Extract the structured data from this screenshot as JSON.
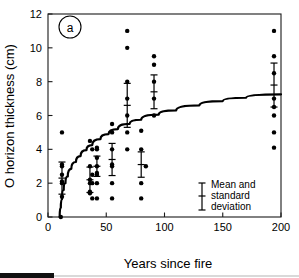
{
  "figure": {
    "panel_label": "a",
    "background_color": "#ffffff",
    "ink_color": "#000000"
  },
  "legend": {
    "name": "mean-and-standard-deviation",
    "lines": [
      "Mean and",
      "standard",
      "deviation"
    ],
    "glyph": "error-bar-icon"
  },
  "chart_data": {
    "type": "scatter",
    "title": "",
    "subtitle": "",
    "xlabel": "Years since fire",
    "ylabel": "O horizon thickness (cm)",
    "xlim": [
      0,
      200
    ],
    "ylim": [
      0,
      12
    ],
    "xticks": [
      0,
      50,
      100,
      150,
      200
    ],
    "xtick_labels": [
      "0",
      "50",
      "100",
      "150",
      "200"
    ],
    "yticks": [
      0,
      2,
      4,
      6,
      8,
      10,
      12
    ],
    "ytick_labels": [
      "0",
      "2",
      "4",
      "6",
      "8",
      "10",
      "12"
    ],
    "grid": false,
    "legend_position": "bottom-right",
    "annotations": [
      {
        "name": "panel-label",
        "text": "a",
        "x": 12,
        "y": 11.2
      }
    ],
    "series": [
      {
        "name": "individual-observations",
        "type": "scatter",
        "marker": "filled-circle",
        "color": "#000000",
        "points": [
          {
            "x": 11,
            "y": 0.0
          },
          {
            "x": 12,
            "y": 1.2
          },
          {
            "x": 12,
            "y": 2.0
          },
          {
            "x": 12,
            "y": 2.1
          },
          {
            "x": 12,
            "y": 2.5
          },
          {
            "x": 12,
            "y": 3.0
          },
          {
            "x": 12,
            "y": 3.1
          },
          {
            "x": 12,
            "y": 5.0
          },
          {
            "x": 36,
            "y": 1.4
          },
          {
            "x": 36,
            "y": 1.5
          },
          {
            "x": 36,
            "y": 2.0
          },
          {
            "x": 36,
            "y": 2.2
          },
          {
            "x": 36,
            "y": 3.0
          },
          {
            "x": 36,
            "y": 4.5
          },
          {
            "x": 38,
            "y": 1.1
          },
          {
            "x": 38,
            "y": 2.0
          },
          {
            "x": 38,
            "y": 2.5
          },
          {
            "x": 38,
            "y": 4.0
          },
          {
            "x": 42,
            "y": 1.1
          },
          {
            "x": 42,
            "y": 2.0
          },
          {
            "x": 42,
            "y": 2.5
          },
          {
            "x": 42,
            "y": 2.6
          },
          {
            "x": 42,
            "y": 3.0
          },
          {
            "x": 42,
            "y": 3.5
          },
          {
            "x": 42,
            "y": 4.0
          },
          {
            "x": 42,
            "y": 4.1
          },
          {
            "x": 55,
            "y": 1.1
          },
          {
            "x": 55,
            "y": 2.0
          },
          {
            "x": 55,
            "y": 3.0
          },
          {
            "x": 55,
            "y": 3.1
          },
          {
            "x": 55,
            "y": 4.0
          },
          {
            "x": 55,
            "y": 5.0
          },
          {
            "x": 55,
            "y": 5.5
          },
          {
            "x": 68,
            "y": 4.0
          },
          {
            "x": 68,
            "y": 5.0
          },
          {
            "x": 68,
            "y": 6.0
          },
          {
            "x": 68,
            "y": 7.0
          },
          {
            "x": 68,
            "y": 8.0
          },
          {
            "x": 68,
            "y": 10.0
          },
          {
            "x": 68,
            "y": 11.0
          },
          {
            "x": 80,
            "y": 1.1
          },
          {
            "x": 80,
            "y": 2.0
          },
          {
            "x": 80,
            "y": 4.0
          },
          {
            "x": 80,
            "y": 5.1
          },
          {
            "x": 84,
            "y": 3.0
          },
          {
            "x": 91,
            "y": 6.0
          },
          {
            "x": 91,
            "y": 7.0
          },
          {
            "x": 91,
            "y": 8.0
          },
          {
            "x": 91,
            "y": 9.0
          },
          {
            "x": 91,
            "y": 9.5
          },
          {
            "x": 194,
            "y": 4.1
          },
          {
            "x": 194,
            "y": 5.0
          },
          {
            "x": 194,
            "y": 6.0
          },
          {
            "x": 194,
            "y": 6.5
          },
          {
            "x": 194,
            "y": 7.0
          },
          {
            "x": 194,
            "y": 8.5
          },
          {
            "x": 194,
            "y": 9.5
          },
          {
            "x": 194,
            "y": 11.0
          }
        ]
      },
      {
        "name": "mean-and-standard-deviation",
        "type": "errorbar",
        "color": "#000000",
        "points": [
          {
            "x": 12,
            "mean": 2.3,
            "sd": 0.95
          },
          {
            "x": 36,
            "mean": 2.2,
            "sd": 0.75
          },
          {
            "x": 42,
            "mean": 3.0,
            "sd": 0.6
          },
          {
            "x": 55,
            "mean": 3.4,
            "sd": 0.95
          },
          {
            "x": 68,
            "mean": 6.6,
            "sd": 1.3
          },
          {
            "x": 80,
            "mean": 3.1,
            "sd": 0.75
          },
          {
            "x": 91,
            "mean": 7.4,
            "sd": 1.0
          },
          {
            "x": 194,
            "mean": 7.8,
            "sd": 1.3
          }
        ]
      },
      {
        "name": "fitted-logarithmic-curve",
        "type": "line",
        "color": "#000000",
        "points": [
          {
            "x": 10.0,
            "y": 0.0
          },
          {
            "x": 11.0,
            "y": 0.55
          },
          {
            "x": 12.0,
            "y": 1.05
          },
          {
            "x": 13.5,
            "y": 1.6
          },
          {
            "x": 15.0,
            "y": 2.0
          },
          {
            "x": 17.0,
            "y": 2.4
          },
          {
            "x": 20.0,
            "y": 2.85
          },
          {
            "x": 24.0,
            "y": 3.25
          },
          {
            "x": 28.0,
            "y": 3.6
          },
          {
            "x": 33.0,
            "y": 3.95
          },
          {
            "x": 38.0,
            "y": 4.25
          },
          {
            "x": 45.0,
            "y": 4.6
          },
          {
            "x": 52.0,
            "y": 4.9
          },
          {
            "x": 60.0,
            "y": 5.2
          },
          {
            "x": 70.0,
            "y": 5.5
          },
          {
            "x": 80.0,
            "y": 5.75
          },
          {
            "x": 95.0,
            "y": 6.05
          },
          {
            "x": 110.0,
            "y": 6.3
          },
          {
            "x": 130.0,
            "y": 6.6
          },
          {
            "x": 150.0,
            "y": 6.85
          },
          {
            "x": 170.0,
            "y": 7.05
          },
          {
            "x": 200.0,
            "y": 7.25
          }
        ]
      }
    ]
  }
}
